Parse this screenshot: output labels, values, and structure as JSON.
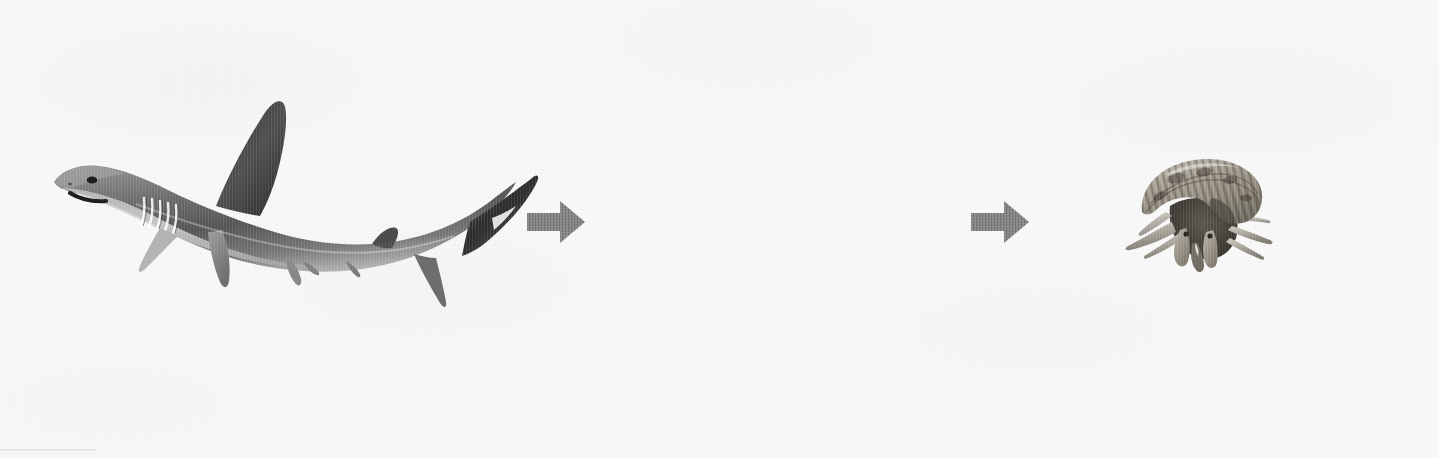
{
  "diagram": {
    "type": "food-chain-sequence",
    "orientation": "horizontal",
    "background_color": "#f8f8f9",
    "caption_color": "#141414",
    "arrow_color": "#8a8a8a",
    "steps": [
      {
        "position": 1,
        "label": "shark",
        "figure": "shark-photo",
        "figure_description": "grayscale photograph of a shark facing left with tail curving upward to the right",
        "filled": true
      },
      {
        "position": 2,
        "label": "",
        "figure": "blank-slot",
        "figure_description": "empty space — organism not shown",
        "filled": false
      },
      {
        "position": 3,
        "label": "hermit crab",
        "figure": "hermit-crab-photo",
        "figure_description": "grayscale photograph of a hermit crab in a banded spiral shell",
        "filled": true
      }
    ],
    "arrows": [
      {
        "index": 1,
        "direction": "right",
        "from": "shark",
        "to": "blank-slot"
      },
      {
        "index": 2,
        "direction": "right",
        "from": "blank-slot",
        "to": "hermit crab"
      }
    ]
  }
}
